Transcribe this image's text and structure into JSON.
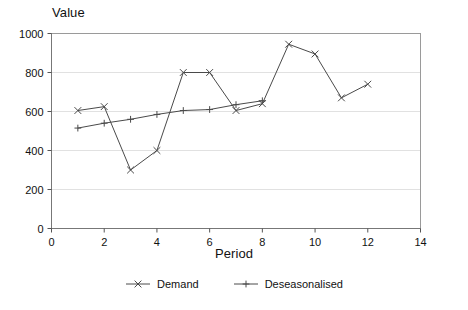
{
  "chart_data": {
    "type": "line",
    "title": "",
    "xlabel": "Period",
    "ylabel": "Value",
    "xlim": [
      0,
      14
    ],
    "ylim": [
      0,
      1000
    ],
    "x_ticks": [
      0,
      2,
      4,
      6,
      8,
      10,
      12,
      14
    ],
    "y_ticks": [
      0,
      200,
      400,
      600,
      800,
      1000
    ],
    "grid": "horizontal",
    "legend_position": "bottom-center",
    "background_color": "#ffffff",
    "gridline_color": "#d9d9d9",
    "axis_color": "#777777",
    "series": [
      {
        "name": "Demand",
        "marker": "x",
        "color": "#4a4a4a",
        "x": [
          1,
          2,
          3,
          4,
          5,
          6,
          7,
          8,
          9,
          10,
          11,
          12
        ],
        "values": [
          605,
          625,
          300,
          400,
          800,
          800,
          605,
          640,
          945,
          895,
          670,
          740
        ]
      },
      {
        "name": "Deseasonalised",
        "marker": "plus",
        "color": "#4a4a4a",
        "x": [
          1,
          2,
          3,
          4,
          5,
          6,
          7,
          8
        ],
        "values": [
          515,
          540,
          560,
          585,
          605,
          610,
          635,
          655
        ]
      }
    ]
  },
  "axes": {
    "y_title": "Value",
    "x_title": "Period"
  },
  "legend": {
    "entries": [
      {
        "label": "Demand",
        "marker": "x"
      },
      {
        "label": "Deseasonalised",
        "marker": "plus"
      }
    ]
  }
}
